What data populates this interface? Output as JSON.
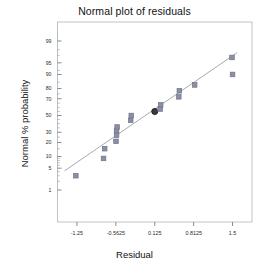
{
  "chart_data": {
    "type": "scatter",
    "title": "Normal plot of residuals",
    "xlabel": "Residual",
    "ylabel": "Normal % probability",
    "grid": false,
    "legend": null,
    "xlim": [
      -1.59375,
      1.84375
    ],
    "xticks": [
      -1.25,
      -0.5625,
      0.125,
      0.8125,
      1.5
    ],
    "xtick_labels": [
      "-1.25",
      "-0.5625",
      "0.125",
      "0.8125",
      "1.5"
    ],
    "yscale": "probit",
    "ylim": [
      0.6,
      99.6
    ],
    "yticks": [
      1,
      5,
      10,
      20,
      30,
      50,
      70,
      80,
      90,
      95,
      99
    ],
    "ytick_labels": [
      "1",
      "5",
      "10",
      "20",
      "30",
      "50",
      "70",
      "80",
      "90",
      "95",
      "99"
    ],
    "yminor_ticks": [
      2,
      3,
      40,
      60,
      97,
      98
    ],
    "marker": "square",
    "marker_color": "#8b8fa3",
    "marker_edge_color": "#6f7488",
    "highlight_marker": "circle",
    "highlight_color": "#3b3b3b",
    "refline_color": "#9aa0a8",
    "frame_color": "#b9bcc2",
    "points": [
      {
        "x": -1.27,
        "y": 3.0,
        "highlight": false
      },
      {
        "x": -0.78,
        "y": 9.0,
        "highlight": false
      },
      {
        "x": -0.76,
        "y": 15.0,
        "highlight": false
      },
      {
        "x": -0.56,
        "y": 21.0,
        "highlight": false
      },
      {
        "x": -0.55,
        "y": 27.0,
        "highlight": false
      },
      {
        "x": -0.55,
        "y": 32.0,
        "highlight": false
      },
      {
        "x": -0.54,
        "y": 36.0,
        "highlight": false
      },
      {
        "x": -0.3,
        "y": 44.0,
        "highlight": false
      },
      {
        "x": -0.29,
        "y": 50.0,
        "highlight": false
      },
      {
        "x": 0.125,
        "y": 55.0,
        "highlight": true
      },
      {
        "x": 0.22,
        "y": 58.0,
        "highlight": false
      },
      {
        "x": 0.23,
        "y": 63.0,
        "highlight": false
      },
      {
        "x": 0.55,
        "y": 72.0,
        "highlight": false
      },
      {
        "x": 0.56,
        "y": 78.0,
        "highlight": false
      },
      {
        "x": 0.83,
        "y": 83.0,
        "highlight": false
      },
      {
        "x": 1.5,
        "y": 90.0,
        "highlight": false
      },
      {
        "x": 1.49,
        "y": 96.5,
        "highlight": false
      }
    ],
    "refline": {
      "x1": -1.47,
      "y1": 4.2,
      "x2": 1.58,
      "y2": 97.5
    }
  }
}
